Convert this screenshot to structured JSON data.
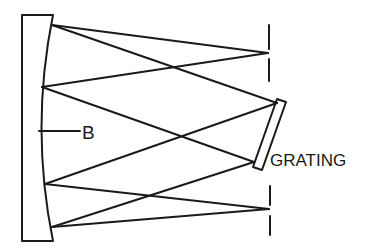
{
  "diagram": {
    "labels": {
      "mirror": "B",
      "grating": "GRATING"
    },
    "colors": {
      "stroke": "#1a1a1a",
      "background": "#ffffff"
    },
    "components": [
      {
        "id": "mirror",
        "label": "B",
        "type": "concave mirror"
      },
      {
        "id": "entrance-slit",
        "type": "slit"
      },
      {
        "id": "grating",
        "label": "GRATING",
        "type": "diffraction grating"
      },
      {
        "id": "exit-slit",
        "type": "slit"
      }
    ]
  }
}
